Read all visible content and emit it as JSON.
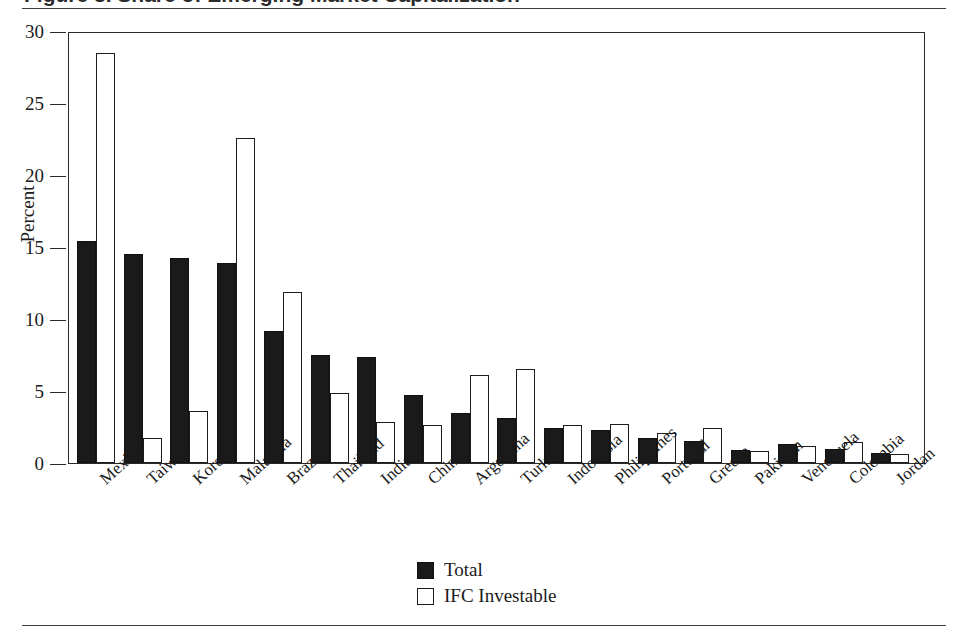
{
  "figure": {
    "title_fragment": "Figure 3.  Share of Emerging Market Capitalization",
    "top_rule": "horizontal-rule",
    "bottom_rule": "horizontal-rule"
  },
  "axes": {
    "y_title": "Percent",
    "y_ticks": [
      "0",
      "5",
      "10",
      "15",
      "20",
      "25",
      "30"
    ]
  },
  "legend": {
    "position": "bottom-center",
    "items": [
      {
        "label": "Total",
        "swatch": "filled-black"
      },
      {
        "label": "IFC Investable",
        "swatch": "outline-white"
      }
    ]
  },
  "chart_data": {
    "type": "bar",
    "title": "Figure 3.  Share of Emerging Market Capitalization",
    "xlabel": "",
    "ylabel": "Percent",
    "ylim": [
      0,
      30
    ],
    "yticks": [
      0,
      5,
      10,
      15,
      20,
      25,
      30
    ],
    "grid": false,
    "legend_position": "bottom-center",
    "categories": [
      "Mexico",
      "Taiwan",
      "Korea",
      "Malaysia",
      "Brazil",
      "Thailand",
      "India",
      "China",
      "Argentina",
      "Turkey",
      "Indonesia",
      "Philippines",
      "Portugal",
      "Greece",
      "Pakistan",
      "Venezuela",
      "Colombia",
      "Jordan"
    ],
    "series": [
      {
        "name": "Total",
        "color": "#1a1a1a",
        "values": [
          15.4,
          14.5,
          14.25,
          13.9,
          9.2,
          7.5,
          7.35,
          4.7,
          3.5,
          3.1,
          2.4,
          2.3,
          1.75,
          1.55,
          0.9,
          1.3,
          0.95,
          0.7
        ]
      },
      {
        "name": "IFC Investable",
        "color": "#ffffff",
        "values": [
          28.5,
          1.75,
          3.6,
          22.6,
          11.85,
          4.85,
          2.85,
          2.65,
          6.1,
          6.5,
          2.65,
          2.7,
          2.1,
          2.4,
          0.85,
          1.15,
          1.45,
          0.6
        ]
      }
    ]
  }
}
